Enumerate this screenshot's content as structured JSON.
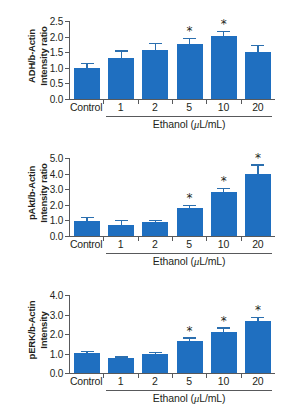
{
  "figure": {
    "xlabel_text_prefix": "Ethanol (",
    "xlabel_mu": "μ",
    "xlabel_text_suffix": "L/mL)",
    "bar_color": "#1f6fc0",
    "axis_color": "#58595b",
    "error_color": "#2b6faf",
    "significance_marker": "*"
  },
  "chart_data": [
    {
      "type": "bar",
      "panel": "a",
      "title": "",
      "ylabel": "ADH/b-Actin\nIntensity ratio",
      "xlabel": "Ethanol (μL/mL)",
      "categories": [
        "Control",
        "1",
        "2",
        "5",
        "10",
        "20"
      ],
      "values": [
        1.0,
        1.32,
        1.58,
        1.77,
        2.02,
        1.5
      ],
      "errors": [
        0.13,
        0.2,
        0.17,
        0.15,
        0.13,
        0.2
      ],
      "significant": [
        false,
        false,
        false,
        true,
        true,
        false
      ],
      "yticks": [
        "0.0",
        "0.5",
        "1.0",
        "1.5",
        "2.0",
        "2.5"
      ],
      "ytickvals": [
        0.0,
        0.5,
        1.0,
        1.5,
        2.0,
        2.5
      ],
      "ylim": [
        0.0,
        2.5
      ],
      "grid": false,
      "legend": "none"
    },
    {
      "type": "bar",
      "panel": "b",
      "title": "",
      "ylabel": "pAkt/b-Actin\nIntensity ratio",
      "xlabel": "Ethanol (μL/mL)",
      "categories": [
        "Control",
        "1",
        "2",
        "5",
        "10",
        "20"
      ],
      "values": [
        0.95,
        0.68,
        0.88,
        1.82,
        2.8,
        3.95
      ],
      "errors": [
        0.2,
        0.27,
        0.1,
        0.09,
        0.22,
        0.56
      ],
      "significant": [
        false,
        false,
        false,
        true,
        true,
        true
      ],
      "yticks": [
        "0.0",
        "1.0",
        "2.0",
        "3.0",
        "4.0",
        "5.0"
      ],
      "ytickvals": [
        0.0,
        1.0,
        2.0,
        3.0,
        4.0,
        5.0
      ],
      "ylim": [
        0.0,
        5.0
      ],
      "grid": false,
      "legend": "none"
    },
    {
      "type": "bar",
      "panel": "c",
      "title": "",
      "ylabel": "pERK/b-Actin\nIntensity",
      "xlabel": "Ethanol (μL/mL)",
      "categories": [
        "Control",
        "1",
        "2",
        "5",
        "10",
        "20"
      ],
      "values": [
        1.02,
        0.75,
        0.97,
        1.65,
        2.12,
        2.65
      ],
      "errors": [
        0.05,
        0.04,
        0.07,
        0.12,
        0.16,
        0.15
      ],
      "significant": [
        false,
        false,
        false,
        true,
        true,
        true
      ],
      "yticks": [
        "0.0",
        "1.0",
        "2.0",
        "3.0",
        "4.0"
      ],
      "ytickvals": [
        0.0,
        1.0,
        2.0,
        3.0,
        4.0
      ],
      "ylim": [
        0.0,
        4.0
      ],
      "grid": false,
      "legend": "none"
    }
  ]
}
